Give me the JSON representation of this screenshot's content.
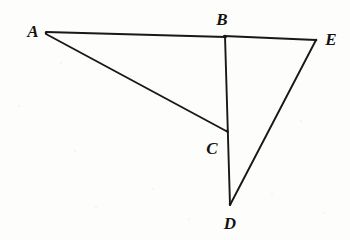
{
  "figure": {
    "kind": "geometry-diagram",
    "background_color": "#fdfdfc",
    "stroke_color": "#1a1714",
    "label_color": "#15120f",
    "width": 350,
    "height": 240,
    "points": [
      {
        "id": "A",
        "label": "A",
        "x": 46,
        "y": 33,
        "label_x": 33,
        "label_y": 31
      },
      {
        "id": "B",
        "label": "B",
        "x": 225,
        "y": 36,
        "label_x": 222,
        "label_y": 19
      },
      {
        "id": "C",
        "label": "C",
        "x": 227,
        "y": 131,
        "label_x": 212,
        "label_y": 148
      },
      {
        "id": "D",
        "label": "D",
        "x": 230,
        "y": 204,
        "label_x": 230,
        "label_y": 223
      },
      {
        "id": "E",
        "label": "E",
        "x": 316,
        "y": 40,
        "label_x": 331,
        "label_y": 39
      }
    ],
    "segments": [
      {
        "id": "AB",
        "from": "A",
        "to": "B",
        "x1": 46,
        "y1": 32,
        "x2": 226,
        "y2": 37,
        "width": 1.9
      },
      {
        "id": "BE",
        "from": "B",
        "to": "E",
        "x1": 224,
        "y1": 36,
        "x2": 316,
        "y2": 40,
        "width": 1.9
      },
      {
        "id": "AC",
        "from": "A",
        "to": "C",
        "x1": 46,
        "y1": 34,
        "x2": 228,
        "y2": 132,
        "width": 1.9
      },
      {
        "id": "BD",
        "from": "B",
        "to": "D",
        "x1": 225,
        "y1": 36,
        "x2": 230,
        "y2": 205,
        "width": 1.9
      },
      {
        "id": "ED",
        "from": "E",
        "to": "D",
        "x1": 316,
        "y1": 40,
        "x2": 230,
        "y2": 205,
        "width": 1.9
      }
    ],
    "specks": [
      {
        "x": 74,
        "y": 150,
        "size": 2
      },
      {
        "x": 152,
        "y": 188,
        "size": 2
      },
      {
        "x": 95,
        "y": 206,
        "size": 2
      },
      {
        "x": 271,
        "y": 193,
        "size": 2
      },
      {
        "x": 300,
        "y": 120,
        "size": 2
      },
      {
        "x": 130,
        "y": 75,
        "size": 2
      },
      {
        "x": 18,
        "y": 105,
        "size": 2
      },
      {
        "x": 188,
        "y": 218,
        "size": 2
      },
      {
        "x": 323,
        "y": 212,
        "size": 2
      },
      {
        "x": 60,
        "y": 62,
        "size": 2
      }
    ]
  }
}
